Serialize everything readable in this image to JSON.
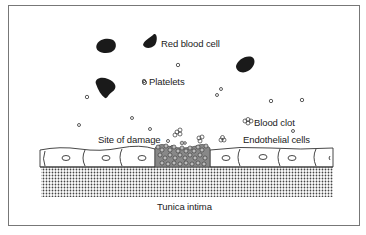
{
  "figure": {
    "labels": {
      "red_blood_cell": "Red blood cell",
      "platelets": "Platelets",
      "blood_clot": "Blood clot",
      "site_of_damage": "Site of damage",
      "endothelial_cells": "Endothelial cells",
      "tunica_intima": "Tunica intima"
    },
    "colors": {
      "border": "#777777",
      "cell_fill": "#1a1a1a",
      "line": "#333333",
      "dot": "#444444"
    }
  }
}
